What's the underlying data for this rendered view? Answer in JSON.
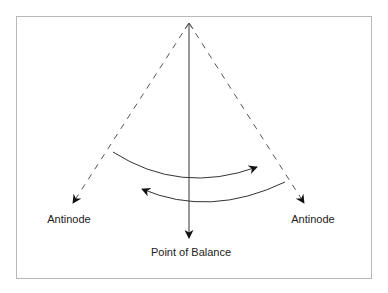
{
  "diagram": {
    "labels": {
      "left": "Antinode",
      "right": "Antinode",
      "bottom": "Point of Balance"
    },
    "colors": {
      "stroke": "#1a1a1a",
      "dashed": "#555555",
      "frame": "#b8b8b8"
    },
    "elements": [
      {
        "id": "center-line",
        "type": "solid-arrow",
        "from": [
          189,
          23
        ],
        "to": [
          189,
          240
        ]
      },
      {
        "id": "left-line",
        "type": "dashed-arrow",
        "from": [
          189,
          23
        ],
        "to": [
          72,
          205
        ]
      },
      {
        "id": "right-line",
        "type": "dashed-arrow",
        "from": [
          189,
          23
        ],
        "to": [
          305,
          205
        ]
      },
      {
        "id": "upper-arc",
        "type": "curved-arrow",
        "direction": "left-to-right"
      },
      {
        "id": "lower-arc",
        "type": "curved-arrow",
        "direction": "right-to-left"
      }
    ]
  }
}
